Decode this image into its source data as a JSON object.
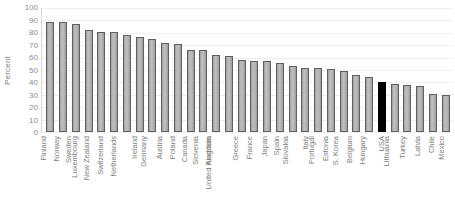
{
  "chart_data": {
    "type": "bar",
    "title": "",
    "xlabel": "",
    "ylabel": "Percent",
    "ylim": [
      0,
      100
    ],
    "ytick_step": 10,
    "grid": true,
    "legend": "none",
    "yticks": [
      "100",
      "90",
      "80",
      "70",
      "60",
      "50",
      "40",
      "30",
      "20",
      "10",
      "0"
    ],
    "categories": [
      "Finland",
      "Norway",
      "Sweden",
      "Luxembourg",
      "New Zealand",
      "Switzerland",
      "Netherlands",
      "Ireland",
      "Germany",
      "Austria",
      "Poland",
      "Canada",
      "Slovenia",
      "Australia",
      "United Kingdom",
      "Greece",
      "France",
      "Japan",
      "Spain",
      "Slovakia",
      "Italy",
      "Portugal",
      "Estonia",
      "S. Korea",
      "Belgium",
      "Hungary",
      "USA",
      "Lithuania",
      "Turkey",
      "Latvia",
      "Chile",
      "Mexico"
    ],
    "values": [
      89,
      89,
      87,
      82,
      81,
      81,
      78,
      77,
      75,
      72,
      71,
      66,
      66,
      62,
      61,
      58,
      57,
      57,
      56,
      53,
      52,
      52,
      51,
      49,
      46,
      44,
      40,
      39,
      38,
      37,
      31,
      30
    ],
    "highlight_category": "USA",
    "colors": {
      "bar": "#a9a9a9",
      "bar_border": "#5f5f5f",
      "highlight_bar": "#000000",
      "gridline": "#efefef",
      "axis": "#d4d4d4",
      "tick_text": "#8c8c8c",
      "label_text": "#808080",
      "background": "#ffffff"
    }
  }
}
